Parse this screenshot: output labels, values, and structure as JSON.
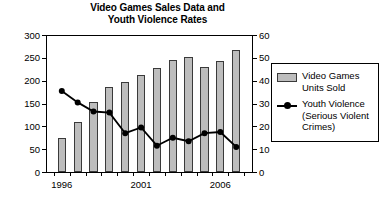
{
  "chart_data": {
    "type": "bar",
    "title": "Video Games Sales Data and Youth Violence Rates",
    "title_line1": "Video Games Sales Data and",
    "title_line2": "Youth Violence Rates",
    "xlabel": "",
    "ylabel": "",
    "grid": false,
    "legend_position": "right",
    "categories": [
      1996,
      1997,
      1998,
      1999,
      2000,
      2001,
      2002,
      2003,
      2004,
      2005,
      2006,
      2007
    ],
    "x_tick_labels": [
      "1996",
      "2001",
      "2006"
    ],
    "x_tick_label_positions": [
      1996,
      2001,
      2006
    ],
    "left_axis": {
      "ylim": [
        0,
        300
      ],
      "ticks": [
        0,
        50,
        100,
        150,
        200,
        250,
        300
      ]
    },
    "right_axis": {
      "ylim": [
        0,
        60
      ],
      "ticks": [
        0,
        10,
        20,
        30,
        40,
        50,
        60
      ]
    },
    "series": [
      {
        "name": "Video Games Units Sold",
        "type": "bar",
        "axis": "left",
        "color": "#bdbdbd",
        "edge_color": "#3a3a3a",
        "values": [
          75,
          110,
          153,
          186,
          198,
          213,
          228,
          245,
          252,
          230,
          244,
          268
        ]
      },
      {
        "name": "Youth Violence (Serious Violent Crimes)",
        "type": "line",
        "axis": "right",
        "color": "#000000",
        "marker": "circle",
        "values": [
          35.5,
          30.5,
          26.5,
          26,
          17,
          19.5,
          11.5,
          15,
          13.5,
          17,
          17.5,
          11
        ]
      }
    ]
  },
  "legend": {
    "items": [
      {
        "label_line1": "Video Games",
        "label_line2": "Units Sold",
        "label_line3": "",
        "marker": "bar-swatch"
      },
      {
        "label_line1": "Youth Violence",
        "label_line2": "(Serious Violent",
        "label_line3": "Crimes)",
        "marker": "line-marker"
      }
    ]
  },
  "colors": {
    "bar_fill": "#bdbdbd",
    "bar_edge": "#3a3a3a",
    "line": "#000000",
    "axis": "#000000",
    "background": "#ffffff"
  }
}
